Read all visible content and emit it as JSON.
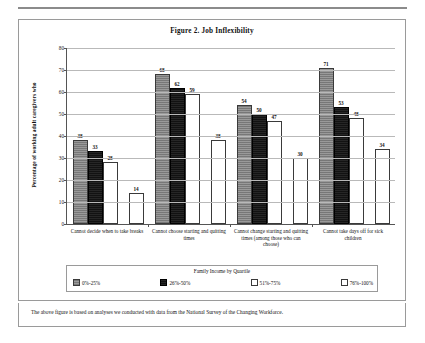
{
  "figure": {
    "title": "Figure 2. Job Inflexibility",
    "footnote": "The above figure is based on analyses we conducted with data from the National Survey of the Changing Workforce."
  },
  "legend": {
    "title": "Family Income by Quartile",
    "items": [
      {
        "label": "0%-25%",
        "swatch": "gray-hatch"
      },
      {
        "label": "26%-50%",
        "swatch": "black"
      },
      {
        "label": "51%-75%",
        "swatch": "white-outline"
      },
      {
        "label": "76%-100%",
        "swatch": "white-outline"
      }
    ]
  },
  "chart_data": {
    "type": "bar",
    "title": "Figure 2. Job Inflexibility",
    "xlabel": "",
    "ylabel": "Percentage of working adult caregivers who",
    "ylim": [
      0,
      80
    ],
    "yticks": [
      0,
      10,
      20,
      30,
      40,
      50,
      60,
      70,
      80
    ],
    "grid": true,
    "legend_position": "bottom",
    "legend_title": "Family Income by Quartile",
    "categories": [
      "Cannot decide when to take breaks",
      "Cannot choose starting and quitting times",
      "Cannot change starting and quitting times (among those who can choose)",
      "Cannot take days off for sick children"
    ],
    "series": [
      {
        "name": "0%-25%",
        "values": [
          38,
          68,
          54,
          71
        ]
      },
      {
        "name": "26%-50%",
        "values": [
          33,
          62,
          50,
          53
        ]
      },
      {
        "name": "51%-75%",
        "values": [
          28,
          59,
          47,
          48
        ]
      },
      {
        "name": "76%-100%",
        "values": [
          14,
          38,
          30,
          34
        ]
      }
    ]
  }
}
